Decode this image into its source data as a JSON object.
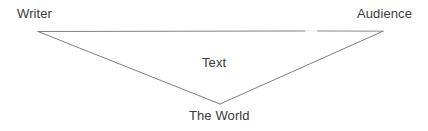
{
  "diagram": {
    "type": "triangle-diagram",
    "background_color": "#ffffff",
    "line_color": "#6e6e6e",
    "text_color": "#3b3b3b",
    "nodes": [
      {
        "id": "writer",
        "label": "Writer",
        "position": "top-left"
      },
      {
        "id": "audience",
        "label": "Audience",
        "position": "top-right"
      },
      {
        "id": "text",
        "label": "Text",
        "position": "center"
      },
      {
        "id": "world",
        "label": "The World",
        "position": "bottom-apex"
      }
    ],
    "vertices": {
      "left": {
        "x": 38,
        "y": 31
      },
      "right": {
        "x": 383,
        "y": 31
      },
      "bottom": {
        "x": 220,
        "y": 104
      }
    },
    "edges": [
      {
        "from": "left",
        "to": "right"
      },
      {
        "from": "left",
        "to": "bottom"
      },
      {
        "from": "right",
        "to": "bottom"
      }
    ]
  }
}
